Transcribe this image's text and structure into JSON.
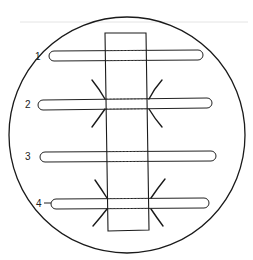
{
  "figure": {
    "colors": {
      "ink": "#1a1a1a",
      "background": "#ffffff"
    },
    "rods": [
      {
        "label": "1",
        "rays": false,
        "leader": false
      },
      {
        "label": "2",
        "rays": true,
        "leader": false
      },
      {
        "label": "3",
        "rays": false,
        "leader": false
      },
      {
        "label": "4",
        "rays": true,
        "leader": true
      }
    ]
  }
}
